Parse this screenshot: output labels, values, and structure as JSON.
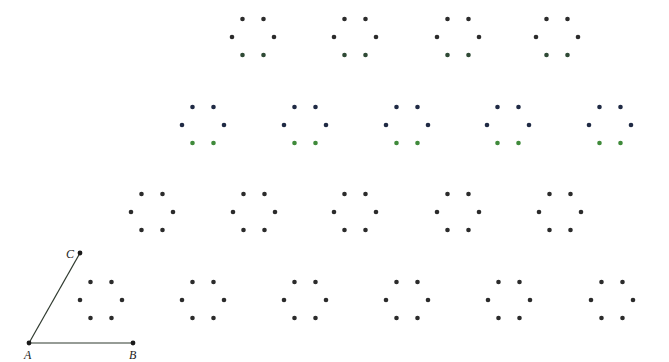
{
  "diagram": {
    "width": 669,
    "height": 362,
    "background": "#ffffff",
    "colors": {
      "dot_default": "#2b2b2b",
      "dot_navy": "#1f2a44",
      "dot_green": "#3f8a3a",
      "dot_darkgreen": "#2f4a35",
      "line": "#2f3a2f"
    },
    "hexagon": {
      "half_width": 21,
      "top_dx": 10.5,
      "dy": 18,
      "dot_radius": 2.3
    },
    "triangle": {
      "points": {
        "A": {
          "x": 29,
          "y": 343,
          "label": "A",
          "label_x": 24,
          "label_y": 359
        },
        "B": {
          "x": 133,
          "y": 343,
          "label": "B",
          "label_x": 129,
          "label_y": 359
        },
        "C": {
          "x": 80,
          "y": 253,
          "label": "C",
          "label_x": 66,
          "label_y": 258
        }
      },
      "segments": [
        [
          "A",
          "C"
        ],
        [
          "A",
          "B"
        ]
      ]
    },
    "rows": [
      {
        "name": "row-1",
        "y": 37,
        "centers": [
          253,
          355,
          458,
          557
        ],
        "colors": {
          "top": "dot_default",
          "side": "dot_default",
          "bottom": "dot_darkgreen"
        }
      },
      {
        "name": "row-2",
        "y": 125,
        "centers": [
          203,
          305,
          407,
          508,
          610
        ],
        "colors": {
          "top": "dot_navy",
          "side": "dot_navy",
          "bottom": "dot_green"
        }
      },
      {
        "name": "row-3",
        "y": 212,
        "centers": [
          152,
          254,
          355,
          458,
          560
        ],
        "colors": {
          "top": "dot_default",
          "side": "dot_default",
          "bottom": "dot_default"
        }
      },
      {
        "name": "row-4",
        "y": 300,
        "centers": [
          101,
          203,
          305,
          407,
          509,
          612
        ],
        "colors": {
          "top": "dot_default",
          "side": "dot_default",
          "bottom": "dot_default"
        }
      }
    ]
  }
}
